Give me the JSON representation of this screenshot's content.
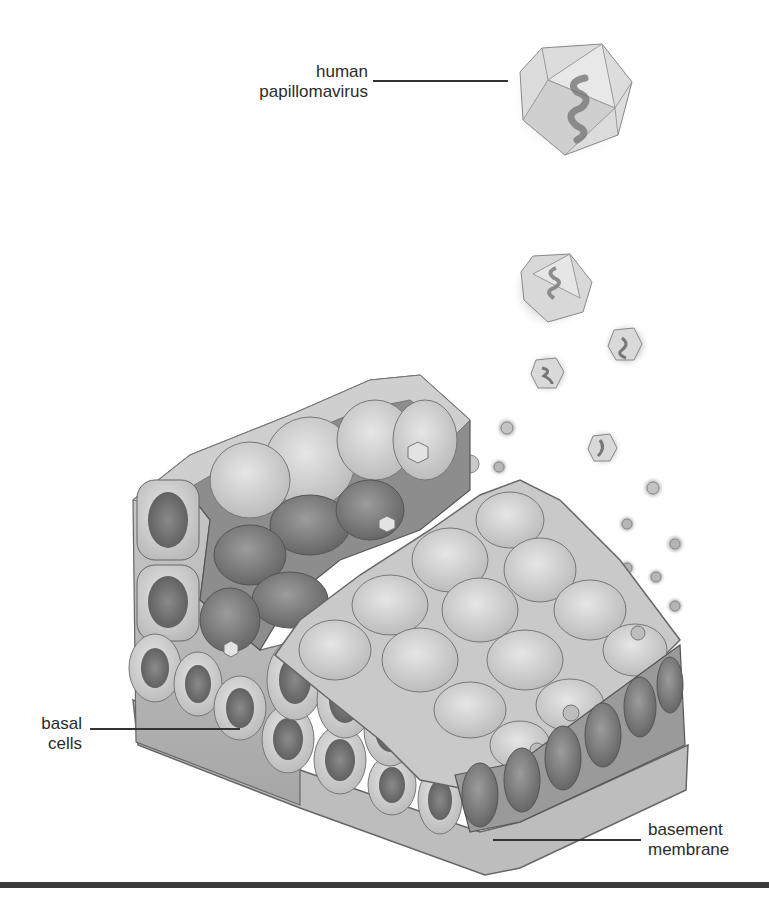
{
  "figure": {
    "labels": {
      "virus": {
        "line1": "human",
        "line2": "papillomavirus"
      },
      "basal": {
        "line1": "basal",
        "line2": "cells"
      },
      "membrane": {
        "line1": "basement",
        "line2": "membrane"
      }
    },
    "colors": {
      "background": "#ffffff",
      "text": "#2b2b2b",
      "leader_line": "#333333",
      "cell_light": "#d6d6d6",
      "cell_mid": "#a9a9a9",
      "cell_dark": "#6e6e6e",
      "nucleus": "#7a7a7a",
      "bottom_rule": "#3a3a3a"
    }
  }
}
